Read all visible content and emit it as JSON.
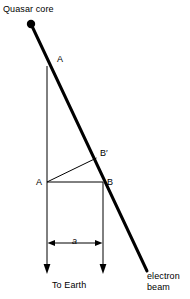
{
  "figure": {
    "name": "quasar-core-electron-beam-geometry",
    "background_color": "#ffffff",
    "ink_color": "#000000",
    "width": 190,
    "height": 299
  },
  "labels": {
    "quasar_core": "Quasar core",
    "point_a_upper": "A",
    "point_a_lower": "A",
    "point_b_prime": "B′",
    "point_b": "B",
    "separation": "a",
    "to_earth": "To Earth",
    "electron_beam_line1": "electron",
    "electron_beam_line2": "beam"
  },
  "geometry": {
    "quasar_core_dot": {
      "cx": 31,
      "cy": 24,
      "r": 4
    },
    "electron_beam": {
      "x1": 31,
      "y1": 24,
      "x2": 147,
      "y2": 271,
      "stroke_width": 3
    },
    "left_sightline": {
      "x": 47,
      "y_top": 66,
      "y_bottom": 273,
      "stroke_width": 1
    },
    "right_sightline": {
      "x": 103,
      "y_top": 182,
      "y_bottom": 273,
      "stroke_width": 1
    },
    "triangle": {
      "a": {
        "x": 47,
        "y": 182
      },
      "b": {
        "x": 103,
        "y": 182
      },
      "b_prime": {
        "x": 96,
        "y": 158
      },
      "stroke_width": 1
    },
    "dimension_line": {
      "y": 243,
      "x_left": 47,
      "x_right": 103,
      "stroke_width": 1
    },
    "arrowhead_size": {
      "width": 5,
      "length": 8
    }
  },
  "icons": {
    "quasar_core_dot": "filled-circle-icon",
    "down_arrow_left": "arrow-down-icon",
    "down_arrow_right": "arrow-down-icon",
    "dimension_arrow_left": "arrow-left-icon",
    "dimension_arrow_right": "arrow-right-icon"
  }
}
